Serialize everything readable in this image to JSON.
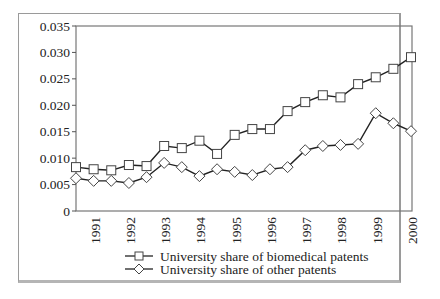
{
  "chart_data": {
    "type": "line",
    "title": "",
    "xlabel": "",
    "ylabel": "",
    "ylim": [
      0,
      0.035
    ],
    "yticks": [
      "0",
      "0.005",
      "0.010",
      "0.015",
      "0.020",
      "0.025",
      "0.030",
      "0.035"
    ],
    "xtick_labels": [
      "1991",
      "1992",
      "1993",
      "1994",
      "1995",
      "1996",
      "1997",
      "1998",
      "1999",
      "2000"
    ],
    "x": [
      1990.5,
      1991,
      1991.5,
      1992,
      1992.5,
      1993,
      1993.5,
      1994,
      1994.5,
      1995,
      1995.5,
      1996,
      1996.5,
      1997,
      1997.5,
      1998,
      1998.5,
      1999,
      1999.5,
      2000
    ],
    "grid": false,
    "legend_position": "bottom",
    "series": [
      {
        "name": "University share of biomedical patents",
        "marker": "square",
        "values": [
          0.0083,
          0.0079,
          0.0077,
          0.0087,
          0.0085,
          0.0123,
          0.0119,
          0.0133,
          0.0108,
          0.0144,
          0.0155,
          0.0155,
          0.0189,
          0.0206,
          0.0219,
          0.0215,
          0.024,
          0.0253,
          0.0269,
          0.0291
        ]
      },
      {
        "name": "University share of other patents",
        "marker": "diamond",
        "values": [
          0.0062,
          0.0057,
          0.0057,
          0.0053,
          0.0064,
          0.0091,
          0.0083,
          0.0066,
          0.0079,
          0.0074,
          0.0068,
          0.0079,
          0.0083,
          0.0115,
          0.0123,
          0.0125,
          0.0127,
          0.0185,
          0.0166,
          0.0151
        ]
      }
    ]
  },
  "legend": {
    "items": [
      {
        "label": "University share of biomedical patents"
      },
      {
        "label": "University share of other patents"
      }
    ]
  }
}
